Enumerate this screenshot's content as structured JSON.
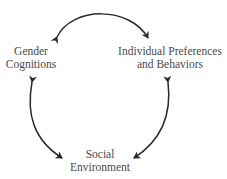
{
  "diagram": {
    "type": "cycle",
    "nodes": {
      "gender_cognitions": {
        "line1": "Gender",
        "line2": "Cognitions"
      },
      "individual_preferences": {
        "line1": "Individual Preferences",
        "line2": "and Behaviors"
      },
      "social_environment": {
        "line1": "Social",
        "line2": "Environment"
      }
    },
    "edges": [
      {
        "from": "Gender Cognitions",
        "to": "Individual Preferences and Behaviors",
        "direction": "bidirectional"
      },
      {
        "from": "Gender Cognitions",
        "to": "Social Environment",
        "direction": "bidirectional"
      },
      {
        "from": "Individual Preferences and Behaviors",
        "to": "Social Environment",
        "direction": "bidirectional"
      }
    ],
    "colors": {
      "text": "#4a4a4a",
      "arrow": "#2a2a2a",
      "background": "#ffffff"
    }
  }
}
